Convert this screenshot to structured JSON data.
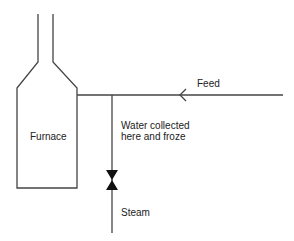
{
  "diagram": {
    "type": "process-schematic",
    "labels": {
      "furnace": "Furnace",
      "feed": "Feed",
      "water_note_line1": "Water collected",
      "water_note_line2": "here and froze",
      "steam": "Steam"
    },
    "components": [
      {
        "id": "furnace",
        "kind": "vessel-with-stack"
      },
      {
        "id": "feed-line",
        "kind": "pipe",
        "flow_direction": "left-toward-furnace"
      },
      {
        "id": "steam-branch",
        "kind": "pipe",
        "orientation": "vertical-down"
      },
      {
        "id": "valve",
        "kind": "gate-valve",
        "location": "steam-branch"
      }
    ],
    "colors": {
      "line": "#444444",
      "valve": "#111111",
      "text": "#222222"
    }
  }
}
